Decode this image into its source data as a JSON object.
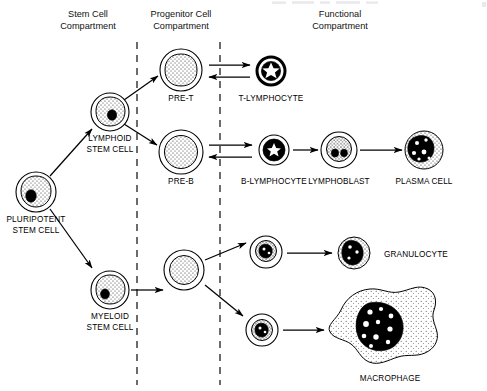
{
  "figure": {
    "background_color": "#ffffff",
    "ink_color": "#000000",
    "width": 487,
    "height": 391
  },
  "headers": [
    {
      "id": "stem",
      "line1": "Stem Cell",
      "line2": "Compartment",
      "x": 88,
      "y1": 17,
      "y2": 29
    },
    {
      "id": "progenitor",
      "line1": "Progenitor Cell",
      "line2": "Compartment",
      "x": 181,
      "y1": 17,
      "y2": 29
    },
    {
      "id": "functional",
      "line1": "Functional",
      "line2": "Compartment",
      "x": 340,
      "y1": 17,
      "y2": 29
    }
  ],
  "dividers": [
    {
      "id": "stem-progenitor-divider",
      "x": 137,
      "y1": 42,
      "y2": 385
    },
    {
      "id": "progenitor-functional-divider",
      "x": 220,
      "y1": 42,
      "y2": 385
    }
  ],
  "cells": [
    {
      "id": "pluripotent-stem-cell",
      "label": "PLURIPOTENT\nSTEM CELL",
      "label_line1": "PLURIPOTENT",
      "label_line2": "STEM CELL",
      "cx": 36,
      "cy": 192,
      "r": 20,
      "type": "stem",
      "label_x": 36,
      "label_y1": 222,
      "label_y2": 233
    },
    {
      "id": "lymphoid-stem-cell",
      "label": "LYMPHOID\nSTEM CELL",
      "label_line1": "LYMPHOID",
      "label_line2": "STEM CELL",
      "cx": 110,
      "cy": 112,
      "r": 19,
      "type": "stem",
      "label_x": 110,
      "label_y1": 141,
      "label_y2": 152
    },
    {
      "id": "myeloid-stem-cell",
      "label": "MYELOID\nSTEM CELL",
      "label_line1": "MYELOID",
      "label_line2": "STEM CELL",
      "cx": 110,
      "cy": 290,
      "r": 19,
      "type": "stem",
      "label_x": 110,
      "label_y1": 319,
      "label_y2": 330
    },
    {
      "id": "pre-t-cell",
      "label": "PRE-T",
      "label_line1": "PRE-T",
      "label_line2": "",
      "cx": 181,
      "cy": 70,
      "r": 21,
      "type": "blast-pale",
      "label_x": 181,
      "label_y1": 101,
      "label_y2": 0
    },
    {
      "id": "pre-b-cell",
      "label": "PRE-B",
      "label_line1": "PRE-B",
      "label_line2": "",
      "cx": 181,
      "cy": 152,
      "r": 22,
      "type": "blast-pale",
      "label_x": 181,
      "label_y1": 184,
      "label_y2": 0
    },
    {
      "id": "myeloid-progenitor",
      "label": "",
      "label_line1": "",
      "label_line2": "",
      "cx": 184,
      "cy": 270,
      "r": 20,
      "type": "blast-pale",
      "label_x": 184,
      "label_y1": 0,
      "label_y2": 0
    },
    {
      "id": "t-lymphocyte",
      "label": "T-LYMPHOCYTE",
      "label_line1": "T-LYMPHOCYTE",
      "label_line2": "",
      "cx": 271,
      "cy": 71,
      "r": 15,
      "type": "lymphocyte",
      "label_x": 271,
      "label_y1": 101,
      "label_y2": 0
    },
    {
      "id": "b-lymphocyte",
      "label": "B-LYMPHOCYTE",
      "label_line1": "B-LYMPHOCYTE",
      "label_line2": "",
      "cx": 274,
      "cy": 150,
      "r": 15,
      "type": "lymphocyte",
      "label_x": 274,
      "label_y1": 184,
      "label_y2": 0
    },
    {
      "id": "lymphoblast",
      "label": "LYMPHOBLAST",
      "label_line1": "LYMPHOBLAST",
      "label_line2": "",
      "cx": 339,
      "cy": 150,
      "r": 18,
      "type": "lymphoblast",
      "label_x": 339,
      "label_y1": 184,
      "label_y2": 0
    },
    {
      "id": "plasma-cell",
      "label": "PLASMA CELL",
      "label_line1": "PLASMA CELL",
      "label_line2": "",
      "cx": 424,
      "cy": 150,
      "r": 19,
      "type": "plasma",
      "label_x": 424,
      "label_y1": 184,
      "label_y2": 0
    },
    {
      "id": "granulocyte-precursor",
      "label": "",
      "label_line1": "",
      "label_line2": "",
      "cx": 266,
      "cy": 252,
      "r": 16,
      "type": "precursor",
      "label_x": 266,
      "label_y1": 0,
      "label_y2": 0
    },
    {
      "id": "granulocyte",
      "label": "GRANULOCYTE",
      "label_line1": "GRANULOCYTE",
      "label_line2": "",
      "cx": 354,
      "cy": 253,
      "r": 16,
      "type": "granulocyte",
      "label_x": 384,
      "label_y1": 257,
      "label_y2": 0
    },
    {
      "id": "monocyte-precursor",
      "label": "",
      "label_line1": "",
      "label_line2": "",
      "cx": 262,
      "cy": 330,
      "r": 16,
      "type": "precursor",
      "label_x": 262,
      "label_y1": 0,
      "label_y2": 0
    },
    {
      "id": "macrophage",
      "label": "MACROPHAGE",
      "label_line1": "MACROPHAGE",
      "label_line2": "",
      "cx": 388,
      "cy": 330,
      "r": 48,
      "type": "macrophage",
      "label_x": 390,
      "label_y1": 381,
      "label_y2": 0
    }
  ],
  "arrows": [
    {
      "id": "arrow-pluripotent-to-lymphoid",
      "from": "pluripotent-stem-cell",
      "to": "lymphoid-stem-cell",
      "kind": "single"
    },
    {
      "id": "arrow-pluripotent-to-myeloid",
      "from": "pluripotent-stem-cell",
      "to": "myeloid-stem-cell",
      "kind": "single"
    },
    {
      "id": "arrow-lymphoid-to-pre-t",
      "from": "lymphoid-stem-cell",
      "to": "pre-t-cell",
      "kind": "single"
    },
    {
      "id": "arrow-lymphoid-to-pre-b",
      "from": "lymphoid-stem-cell",
      "to": "pre-b-cell",
      "kind": "single"
    },
    {
      "id": "arrow-pre-t-to-t-lymphocyte",
      "from": "pre-t-cell",
      "to": "t-lymphocyte",
      "kind": "reversible"
    },
    {
      "id": "arrow-pre-b-to-b-lymphocyte",
      "from": "pre-b-cell",
      "to": "b-lymphocyte",
      "kind": "reversible"
    },
    {
      "id": "arrow-b-lymphocyte-to-lymphoblast",
      "from": "b-lymphocyte",
      "to": "lymphoblast",
      "kind": "single"
    },
    {
      "id": "arrow-lymphoblast-to-plasma-cell",
      "from": "lymphoblast",
      "to": "plasma-cell",
      "kind": "single"
    },
    {
      "id": "arrow-myeloid-to-progenitor",
      "from": "myeloid-stem-cell",
      "to": "myeloid-progenitor",
      "kind": "single"
    },
    {
      "id": "arrow-progenitor-to-granulocyte-precursor",
      "from": "myeloid-progenitor",
      "to": "granulocyte-precursor",
      "kind": "single"
    },
    {
      "id": "arrow-progenitor-to-monocyte-precursor",
      "from": "myeloid-progenitor",
      "to": "monocyte-precursor",
      "kind": "single"
    },
    {
      "id": "arrow-granulocyte-precursor-to-granulocyte",
      "from": "granulocyte-precursor",
      "to": "granulocyte",
      "kind": "single"
    },
    {
      "id": "arrow-monocyte-precursor-to-macrophage",
      "from": "monocyte-precursor",
      "to": "macrophage",
      "kind": "single"
    }
  ]
}
